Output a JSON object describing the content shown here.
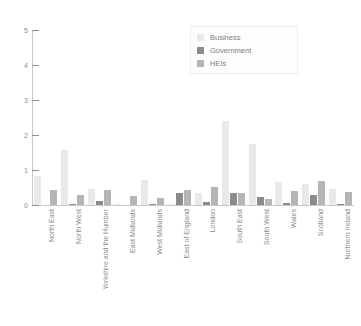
{
  "chart_data": {
    "type": "bar",
    "title": "",
    "subtitle": "",
    "xlabel": "",
    "ylabel": "",
    "ylim": [
      0,
      5
    ],
    "yticks": [
      0,
      1,
      2,
      3,
      4,
      5
    ],
    "ytick_labels": [
      "0",
      "1",
      "2",
      "3",
      "4",
      "5"
    ],
    "grid": false,
    "legend_position": "top-right",
    "categories": [
      "North East",
      "North West",
      "Yorkshire and the Humber",
      "East Midlands",
      "West Midlands",
      "East of England",
      "London",
      "South East",
      "South West",
      "Wales",
      "Scotland",
      "Northern Ireland"
    ],
    "series": [
      {
        "name": "Business",
        "color": "#e9e9e9",
        "values": [
          0.83,
          1.58,
          0.46,
          0.02,
          0.72,
          0.02,
          0.33,
          2.39,
          1.75,
          0.66,
          0.61,
          0.46
        ]
      },
      {
        "name": "Government",
        "color": "#8b8b8b",
        "values": [
          0.0,
          0.02,
          0.12,
          0.0,
          0.02,
          0.33,
          0.08,
          0.34,
          0.23,
          0.05,
          0.28,
          0.03
        ]
      },
      {
        "name": "HEIs",
        "color": "#b5b5b5",
        "values": [
          0.42,
          0.3,
          0.42,
          0.27,
          0.21,
          0.43,
          0.51,
          0.35,
          0.17,
          0.39,
          0.7,
          0.37
        ]
      }
    ]
  },
  "legend": {
    "items": [
      {
        "label": "Business",
        "color": "#e9e9e9"
      },
      {
        "label": "Government",
        "color": "#8b8b8b"
      },
      {
        "label": "HEIs",
        "color": "#b5b5b5"
      }
    ]
  },
  "axes": {
    "y_max": 5,
    "y_min": 0
  }
}
